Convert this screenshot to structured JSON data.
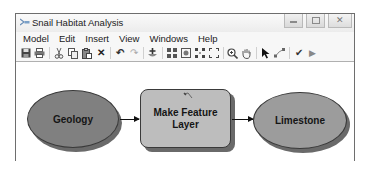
{
  "window": {
    "title": "Snail Habitat Analysis",
    "icon": "model-builder-icon",
    "controls": [
      {
        "name": "minimize",
        "glyph": "▭"
      },
      {
        "name": "maximize",
        "glyph": "▣"
      },
      {
        "name": "close",
        "glyph": "✕"
      }
    ]
  },
  "menu": {
    "items": [
      "Model",
      "Edit",
      "Insert",
      "View",
      "Windows",
      "Help"
    ]
  },
  "toolbar": {
    "groups": [
      [
        "save-icon",
        "print-icon"
      ],
      [
        "cut-icon",
        "copy-icon",
        "paste-icon",
        "delete-icon"
      ],
      [
        "undo-icon",
        "redo-icon"
      ],
      [
        "add-data-icon"
      ],
      [
        "auto-layout-icon",
        "full-extent-icon",
        "fixed-zoom-in-icon",
        "fixed-zoom-out-icon",
        "zoom-in-icon",
        "pan-icon"
      ],
      [
        "select-icon",
        "connect-icon"
      ],
      [
        "validate-icon",
        "run-icon"
      ]
    ],
    "glyphs": {
      "delete-icon": "✕",
      "undo-icon": "↶",
      "redo-icon": "↷",
      "validate-icon": "✔",
      "run-icon": "▶",
      "select-icon": "➤"
    }
  },
  "model": {
    "input": {
      "label": "Geology",
      "fill": "#808080"
    },
    "process": {
      "label_line1": "Make Feature",
      "label_line2": "Layer",
      "fill": "#bdbdbd"
    },
    "output": {
      "label": "Limestone",
      "fill": "#9c9c9c"
    }
  }
}
